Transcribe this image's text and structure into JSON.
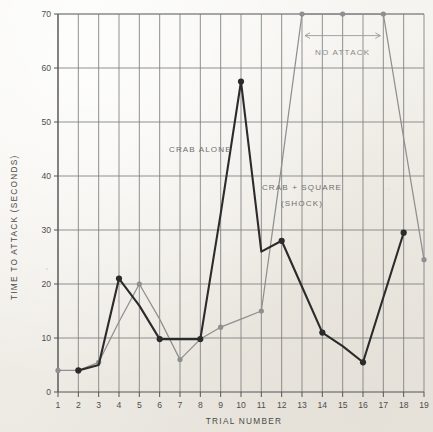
{
  "chart_data": {
    "type": "line",
    "title": "",
    "xlabel": "TRIAL NUMBER",
    "ylabel": "TIME TO ATTACK (SECONDS)",
    "x": [
      1,
      2,
      3,
      4,
      5,
      6,
      7,
      8,
      9,
      10,
      11,
      12,
      13,
      14,
      15,
      16,
      17,
      18,
      19
    ],
    "xlim": [
      1,
      19
    ],
    "ylim": [
      0,
      70
    ],
    "xticks": [
      "1",
      "2",
      "3",
      "4",
      "5",
      "6",
      "7",
      "8",
      "9",
      "10",
      "11",
      "12",
      "13",
      "14",
      "15",
      "16",
      "17",
      "18",
      "19"
    ],
    "yticks": [
      "0",
      "10",
      "20",
      "30",
      "40",
      "50",
      "60",
      "70"
    ],
    "ytick_values": [
      0,
      10,
      20,
      30,
      40,
      50,
      60,
      70
    ],
    "grid": true,
    "legend_position": "inline-annotations",
    "series": [
      {
        "name": "CRAB ALONE",
        "color": "#2b2b2b",
        "x": [
          2,
          3,
          4,
          5,
          6,
          7,
          8,
          9,
          10,
          11,
          12,
          13,
          14,
          15,
          16,
          17,
          18,
          19
        ],
        "values": [
          4,
          5,
          21,
          16,
          9.8,
          9.8,
          9.8,
          33,
          57.5,
          26,
          28,
          19.5,
          11,
          8.5,
          5.5,
          17.5,
          29.5,
          null
        ],
        "markers": [
          2,
          4,
          6,
          8,
          10,
          12,
          14,
          16,
          18
        ],
        "marker_values": [
          4,
          21,
          9.8,
          9.8,
          57.5,
          28,
          11,
          5.5,
          29.5
        ]
      },
      {
        "name": "CRAB + SQUARE (SHOCK)",
        "color": "#8f8f8f",
        "x": [
          1,
          2,
          3,
          4,
          5,
          6,
          7,
          8,
          9,
          10,
          11,
          12,
          13,
          14,
          15,
          16,
          17,
          18,
          19
        ],
        "values": [
          4,
          4,
          5.5,
          13,
          20,
          13.5,
          6,
          9.8,
          12,
          13.5,
          15,
          42,
          70,
          70,
          70,
          70,
          70,
          47,
          24.5
        ],
        "markers": [
          1,
          3,
          5,
          7,
          9,
          11,
          13,
          15,
          17,
          19
        ],
        "marker_values": [
          4,
          5.5,
          20,
          6,
          12,
          15,
          70,
          70,
          70,
          24.5
        ]
      }
    ],
    "annotations": [
      {
        "text": "CRAB ALONE",
        "type": "series-label",
        "x_trial": 8.0,
        "y_value": 44.5
      },
      {
        "text": "CRAB + SQUARE",
        "type": "series-label",
        "x_trial": 13.0,
        "y_value": 37.5
      },
      {
        "text": "(SHOCK)",
        "type": "series-label",
        "x_trial": 13.0,
        "y_value": 34.5
      },
      {
        "text": "NO ATTACK",
        "type": "range-annotation",
        "arrow_from_trial": 13,
        "arrow_to_trial": 17,
        "arrow_y_value": 66.0,
        "label_y_value": 62.5
      }
    ]
  }
}
